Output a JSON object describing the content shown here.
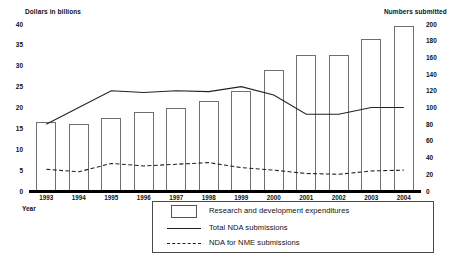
{
  "axes": {
    "left_title": "Dollars in billions",
    "right_title": "Numbers submitted",
    "year_caption": "Year",
    "left_ticks": [
      "40",
      "35",
      "30",
      "25",
      "20",
      "15",
      "10",
      "5",
      "0"
    ],
    "right_ticks": [
      "200",
      "180",
      "160",
      "140",
      "120",
      "100",
      "80",
      "60",
      "40",
      "20",
      "0"
    ]
  },
  "legend": {
    "items": [
      {
        "label": "Research and development expenditures",
        "mark": "bar-swatch-icon"
      },
      {
        "label": "Total NDA submissions",
        "mark": "solid-line-icon"
      },
      {
        "label": "NDA for NME submissions",
        "mark": "dashed-line-icon"
      }
    ]
  },
  "chart_data": {
    "type": "bar",
    "title": "",
    "xlabel": "Year",
    "ylabel": "Dollars in billions",
    "y2label": "Numbers submitted",
    "ylim": [
      0,
      40
    ],
    "y2lim": [
      0,
      200
    ],
    "grid": false,
    "legend_position": "bottom",
    "categories": [
      "1993",
      "1994",
      "1995",
      "1996",
      "1997",
      "1998",
      "1999",
      "2000",
      "2001",
      "2002",
      "2003",
      "2004"
    ],
    "series": [
      {
        "name": "Research and development expenditures",
        "type": "bar",
        "axis": "left",
        "unit": "billions of dollars",
        "values": [
          16.5,
          16,
          17.5,
          19,
          20,
          21.5,
          24,
          29,
          32.5,
          32.5,
          36.5,
          39.5
        ]
      },
      {
        "name": "Total NDA submissions",
        "type": "line",
        "style": "solid",
        "axis": "right",
        "unit": "submissions",
        "values": [
          80,
          100,
          120,
          118,
          120,
          119,
          125,
          115,
          92,
          92,
          100,
          100
        ]
      },
      {
        "name": "NDA for NME submissions",
        "type": "line",
        "style": "dashed",
        "axis": "right",
        "unit": "submissions",
        "values": [
          26,
          23,
          33,
          30,
          32,
          34,
          28,
          25,
          21,
          20,
          24,
          25
        ]
      }
    ]
  }
}
